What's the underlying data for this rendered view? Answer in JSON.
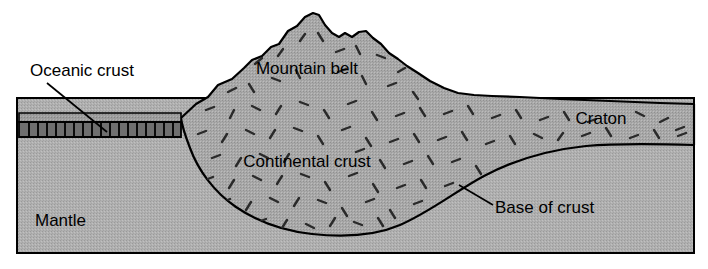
{
  "diagram": {
    "type": "cross-section",
    "frame": {
      "x": 17,
      "y": 98,
      "width": 677,
      "height": 155
    },
    "colors": {
      "background": "#ffffff",
      "mantle_fill": "#b3b3b3",
      "continental_crust_fill": "#ababab",
      "oceanic_crust_upper_fill": "#a0a0a0",
      "oceanic_crust_hatched_fill": "#6e6e6e",
      "outline": "#000000",
      "label_text": "#000000"
    },
    "labels": [
      {
        "id": "oceanic-crust",
        "text": "Oceanic crust",
        "x": 30,
        "y": 72,
        "anchor": "start",
        "leader": true
      },
      {
        "id": "mountain-belt",
        "text": "Mountain belt",
        "x": 307,
        "y": 70,
        "anchor": "middle",
        "leader": false
      },
      {
        "id": "craton",
        "text": "Craton",
        "x": 601,
        "y": 120,
        "anchor": "middle",
        "leader": false
      },
      {
        "id": "continental-crust",
        "text": "Continental crust",
        "x": 307,
        "y": 163,
        "anchor": "middle",
        "leader": false
      },
      {
        "id": "base-of-crust",
        "text": "Base of crust",
        "x": 495,
        "y": 209,
        "anchor": "start",
        "leader": true
      },
      {
        "id": "mantle",
        "text": "Mantle",
        "x": 35,
        "y": 222,
        "anchor": "start",
        "leader": false
      }
    ],
    "leader_lines": [
      {
        "id": "oceanic-crust-leader",
        "x1": 47,
        "y1": 83,
        "x2": 107,
        "y2": 132
      },
      {
        "id": "base-of-crust-leader",
        "x1": 459,
        "y1": 185,
        "x2": 493,
        "y2": 205
      }
    ],
    "features": {
      "oceanic_crust": {
        "name": "Oceanic crust",
        "left_x": 19,
        "right_x": 181,
        "top_y": 113,
        "band_top_y": 122,
        "band_bottom_y": 137,
        "tick_count": 17
      },
      "mountain_belt": {
        "name": "Mountain belt",
        "peak_x": 318,
        "peak_y": 13,
        "secondary_peak_x": 370,
        "secondary_peak_y": 31
      },
      "craton": {
        "name": "Craton",
        "surface_left_y": 96,
        "surface_right_y": 104
      },
      "continental_crust": {
        "name": "Continental crust",
        "root_deepest_x": 330,
        "root_deepest_y": 236
      },
      "mantle": {
        "name": "Mantle"
      }
    }
  }
}
